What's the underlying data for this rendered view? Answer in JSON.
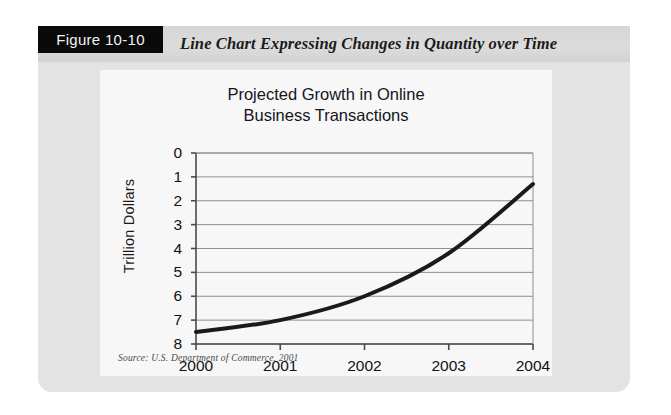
{
  "figure": {
    "tab_label": "Figure 10-10",
    "caption": "Line Chart Expressing Changes in Quantity over Time"
  },
  "source_note": "Source: U.S. Department of Commerce, 2001",
  "colors": {
    "panel_background": "#e3e3e3",
    "header_band": "#d8d8d8",
    "tab_background": "#0a0a0a",
    "tab_text": "#f2f2f2",
    "card_background": "#f7f7f7",
    "line_color": "#1a1a1a",
    "grid_color": "#8f8f8f",
    "axis_color": "#4a4a4a",
    "text_color": "#15151b"
  },
  "chart_data": {
    "type": "line",
    "title": "Projected Growth in Online Business Transactions",
    "title_line_1": "Projected Growth in Online",
    "title_line_2": "Business Transactions",
    "xlabel": "",
    "ylabel": "Trillion Dollars",
    "categories": [
      "2000",
      "2001",
      "2002",
      "2003",
      "2004"
    ],
    "values": [
      0.5,
      1.0,
      2.0,
      3.8,
      6.7
    ],
    "series": [
      {
        "name": "Online Business Transactions",
        "values": [
          0.5,
          1.0,
          2.0,
          3.8,
          6.7
        ]
      }
    ],
    "ylim": [
      0,
      8
    ],
    "y_ticks": [
      "0",
      "1",
      "2",
      "3",
      "4",
      "5",
      "6",
      "7",
      "8"
    ],
    "x_ticks": [
      "2000",
      "2001",
      "2002",
      "2003",
      "2004"
    ],
    "grid": true,
    "grid_axis": "y",
    "legend": false,
    "legend_position": "none",
    "markers": false,
    "line_width": 4,
    "smooth": true
  }
}
